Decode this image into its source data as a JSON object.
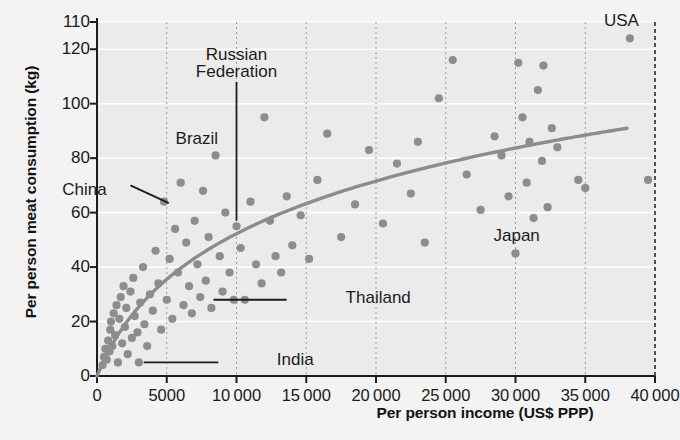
{
  "chart_data": {
    "type": "scatter",
    "title": "",
    "xlabel": "Per person income (US$ PPP)",
    "ylabel": "Per person meat consumption (kg)",
    "xlim": [
      0,
      40000
    ],
    "ylim": [
      0,
      130
    ],
    "grid": "white horizontal gridlines, dashed vertical gridlines",
    "legend": "none",
    "xticks": [
      0,
      5000,
      10000,
      15000,
      20000,
      25000,
      30000,
      35000,
      40000
    ],
    "xtick_labels": [
      "0",
      "5000",
      "10 000",
      "15 000",
      "20 000",
      "25 000",
      "30 000",
      "35 000",
      "40 000"
    ],
    "yticks": [
      0,
      20,
      40,
      60,
      80,
      100,
      120,
      130
    ],
    "ytick_labels": [
      "0",
      "20",
      "40",
      "60",
      "80",
      "100",
      "120",
      "110"
    ],
    "marker_color": "#8d8d8d",
    "trend_color": "#8c8c8c",
    "plot_bg": "#ebebeb",
    "points": [
      [
        400,
        4
      ],
      [
        500,
        7
      ],
      [
        600,
        10
      ],
      [
        700,
        6
      ],
      [
        800,
        13
      ],
      [
        900,
        9
      ],
      [
        950,
        17
      ],
      [
        1000,
        20
      ],
      [
        1100,
        11
      ],
      [
        1200,
        23
      ],
      [
        1300,
        15
      ],
      [
        1400,
        26
      ],
      [
        1500,
        5
      ],
      [
        1600,
        21
      ],
      [
        1700,
        29
      ],
      [
        1800,
        12
      ],
      [
        1900,
        33
      ],
      [
        2000,
        18
      ],
      [
        2100,
        25
      ],
      [
        2200,
        8
      ],
      [
        2400,
        31
      ],
      [
        2500,
        14
      ],
      [
        2600,
        36
      ],
      [
        2700,
        22
      ],
      [
        2900,
        16
      ],
      [
        3000,
        5
      ],
      [
        3100,
        27
      ],
      [
        3300,
        40
      ],
      [
        3400,
        19
      ],
      [
        3600,
        11
      ],
      [
        3800,
        30
      ],
      [
        4000,
        24
      ],
      [
        4200,
        46
      ],
      [
        4400,
        34
      ],
      [
        4600,
        17
      ],
      [
        4800,
        64
      ],
      [
        5000,
        28
      ],
      [
        5200,
        43
      ],
      [
        5400,
        21
      ],
      [
        5600,
        54
      ],
      [
        5800,
        38
      ],
      [
        6000,
        71
      ],
      [
        6200,
        26
      ],
      [
        6400,
        49
      ],
      [
        6600,
        33
      ],
      [
        6800,
        23
      ],
      [
        7000,
        57
      ],
      [
        7200,
        41
      ],
      [
        7400,
        29
      ],
      [
        7600,
        68
      ],
      [
        7800,
        35
      ],
      [
        8000,
        51
      ],
      [
        8200,
        25
      ],
      [
        8500,
        81
      ],
      [
        8800,
        44
      ],
      [
        9000,
        31
      ],
      [
        9200,
        60
      ],
      [
        9500,
        38
      ],
      [
        9800,
        28
      ],
      [
        10000,
        55
      ],
      [
        10300,
        47
      ],
      [
        10600,
        28
      ],
      [
        11000,
        64
      ],
      [
        11400,
        41
      ],
      [
        11800,
        34
      ],
      [
        12000,
        95
      ],
      [
        12400,
        57
      ],
      [
        12800,
        44
      ],
      [
        13200,
        38
      ],
      [
        13600,
        66
      ],
      [
        14000,
        48
      ],
      [
        14600,
        59
      ],
      [
        15200,
        43
      ],
      [
        15800,
        72
      ],
      [
        16500,
        89
      ],
      [
        17500,
        51
      ],
      [
        18500,
        63
      ],
      [
        19500,
        83
      ],
      [
        20500,
        56
      ],
      [
        21500,
        78
      ],
      [
        22500,
        67
      ],
      [
        23000,
        86
      ],
      [
        23500,
        49
      ],
      [
        24500,
        102
      ],
      [
        25500,
        116
      ],
      [
        26500,
        74
      ],
      [
        27500,
        61
      ],
      [
        28500,
        88
      ],
      [
        29000,
        81
      ],
      [
        29500,
        66
      ],
      [
        30000,
        45
      ],
      [
        30200,
        115
      ],
      [
        30500,
        95
      ],
      [
        30800,
        71
      ],
      [
        31000,
        86
      ],
      [
        31300,
        58
      ],
      [
        31600,
        105
      ],
      [
        31900,
        79
      ],
      [
        32000,
        114
      ],
      [
        32300,
        62
      ],
      [
        32600,
        91
      ],
      [
        33000,
        84
      ],
      [
        34500,
        72
      ],
      [
        35000,
        69
      ],
      [
        39500,
        72
      ],
      [
        38200,
        124
      ]
    ],
    "trend_curve_note": "logarithmic-style fit rising from ~0 at x=0 to ~91 at x=38000",
    "annotations": [
      {
        "label": "USA",
        "x": 38200,
        "y": 124,
        "position": "above-point"
      },
      {
        "label": "Japan",
        "x": 30000,
        "y": 45,
        "position": "above-point"
      },
      {
        "label": "Russian\nFederation",
        "x": 10000,
        "y": 55,
        "position": "above-leader-line"
      },
      {
        "label": "Brazil",
        "x": 8500,
        "y": 81,
        "position": "above-point"
      },
      {
        "label": "China",
        "x": 5400,
        "y": 62,
        "position": "upper-left-leader"
      },
      {
        "label": "Thailand",
        "x": 8000,
        "y": 28,
        "position": "right-leader"
      },
      {
        "label": "India",
        "x": 3000,
        "y": 5,
        "position": "right-leader"
      }
    ]
  },
  "axis": {
    "y_title": "Per person meat consumption (kg)",
    "x_title": "Per person income (US$ PPP)"
  },
  "annotations": {
    "usa": "USA",
    "japan": "Japan",
    "russian_line1": "Russian",
    "russian_line2": "Federation",
    "brazil": "Brazil",
    "china": "China",
    "thailand": "Thailand",
    "india": "India"
  }
}
